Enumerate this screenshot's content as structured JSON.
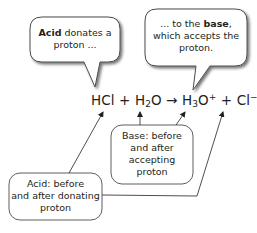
{
  "callouts": {
    "acid_donates": {
      "bold": "Acid",
      "rest_line1": " donates a",
      "line2": "proton ..."
    },
    "to_base": {
      "line1": "... to the ",
      "bold": "base",
      "line1_end": ",",
      "line2": "which accepts the",
      "line3": "proton."
    }
  },
  "equation": {
    "hcl": "HCl",
    "plus1": "+",
    "h2o_h": "H",
    "h2o_sub": "2",
    "h2o_o": "O",
    "arrow": "→",
    "h3o_h": "H",
    "h3o_sub": "3",
    "h3o_o": "O",
    "h3o_sup": "+",
    "plus2": "+",
    "cl": "Cl",
    "cl_sup": "−"
  },
  "labels": {
    "base_box": {
      "line1": "Base: before",
      "line2": "and after",
      "line3": "accepting",
      "line4": "proton"
    },
    "acid_box": {
      "line1": "Acid: before",
      "line2": "and after donating",
      "line3": "proton"
    }
  },
  "colors": {
    "stroke": "#4d4d4d",
    "text": "#231f20",
    "shadow": "#9a9a9a"
  }
}
